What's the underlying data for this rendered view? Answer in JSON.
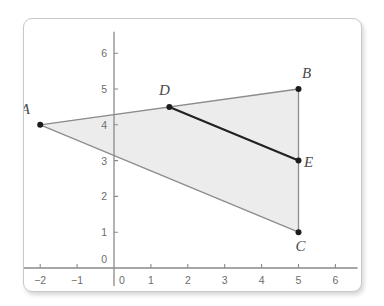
{
  "figure": {
    "title": "",
    "background_color": "#ffffff",
    "border_color": "#c9c9c9"
  },
  "chart_data": {
    "type": "scatter",
    "title": "",
    "xlabel": "",
    "ylabel": "",
    "xlim": [
      -2.6,
      6.6
    ],
    "ylim": [
      -0.5,
      6.6
    ],
    "grid": false,
    "x_ticks": [
      -2,
      -1,
      0,
      1,
      2,
      3,
      4,
      5,
      6
    ],
    "y_ticks": [
      0,
      1,
      2,
      3,
      4,
      5,
      6
    ],
    "x_tick_labels": [
      "−2",
      "−1",
      "0",
      "1",
      "2",
      "3",
      "4",
      "5",
      "6"
    ],
    "y_tick_labels": [
      "0",
      "1",
      "2",
      "3",
      "4",
      "5",
      "6"
    ],
    "points": [
      {
        "name": "A",
        "x": -2,
        "y": 4,
        "label": "A",
        "label_dx": -15,
        "label_dy": -11
      },
      {
        "name": "B",
        "x": 5,
        "y": 5,
        "label": "B",
        "label_dx": 8,
        "label_dy": -11
      },
      {
        "name": "C",
        "x": 5,
        "y": 1,
        "label": "C",
        "label_dx": 2,
        "label_dy": 19
      },
      {
        "name": "D",
        "x": 1.5,
        "y": 4.5,
        "label": "D",
        "label_dx": -5,
        "label_dy": -12
      },
      {
        "name": "E",
        "x": 5,
        "y": 3,
        "label": "E",
        "label_dx": 10,
        "label_dy": 6
      }
    ],
    "segments": [
      {
        "name": "AB",
        "from": "A",
        "to": "B",
        "color": "#8c8c8c",
        "width": 1.3,
        "emphasis": "light"
      },
      {
        "name": "BC",
        "from": "B",
        "to": "C",
        "color": "#8c8c8c",
        "width": 1.3,
        "emphasis": "light"
      },
      {
        "name": "CA",
        "from": "C",
        "to": "A",
        "color": "#8c8c8c",
        "width": 1.3,
        "emphasis": "light"
      },
      {
        "name": "DE",
        "from": "D",
        "to": "E",
        "color": "#222222",
        "width": 2.2,
        "emphasis": "bold"
      }
    ],
    "shaded_region": {
      "name": "triangle-ABC",
      "vertices": [
        "A",
        "B",
        "C"
      ],
      "fill": "#ececec"
    },
    "axis_color": "#8a8a8a",
    "point_color": "#1c1c1c",
    "origin_label_x": "0",
    "origin_label_y": "0"
  }
}
